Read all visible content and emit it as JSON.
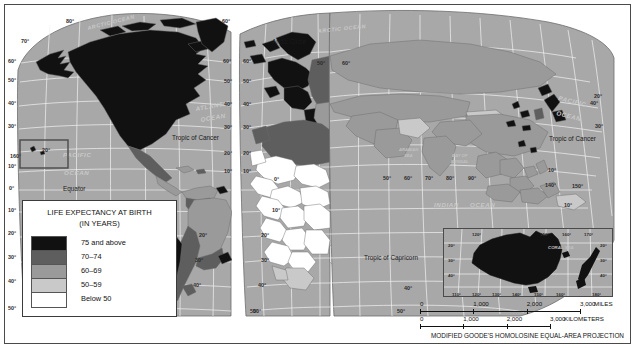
{
  "legend": {
    "title_line1": "LIFE EXPECTANCY AT BIRTH",
    "title_line2": "(IN YEARS)",
    "classes": [
      {
        "label": "75 and above",
        "color": "#111111"
      },
      {
        "label": "70–74",
        "color": "#5e5e5e"
      },
      {
        "label": "60–69",
        "color": "#9a9a9a"
      },
      {
        "label": "50–59",
        "color": "#c9c9c9"
      },
      {
        "label": "Below 50",
        "color": "#ffffff"
      }
    ]
  },
  "map": {
    "ocean_labels": [
      {
        "text": "ARCTIC OCEAN",
        "x": 88,
        "y": 30,
        "size": 5.4,
        "rot": -14
      },
      {
        "text": "ARCTIC OCEAN",
        "x": 318,
        "y": 33,
        "size": 5.4,
        "rot": -6
      },
      {
        "text": "ATLANTIC",
        "x": 196,
        "y": 111,
        "size": 6.2,
        "rot": -10
      },
      {
        "text": "OCEAN",
        "x": 201,
        "y": 122,
        "size": 6.2,
        "rot": -10
      },
      {
        "text": "PACIFIC",
        "x": 63,
        "y": 157,
        "size": 6.2,
        "rot": 0
      },
      {
        "text": "OCEAN",
        "x": 64,
        "y": 175,
        "size": 6.2,
        "rot": 0
      },
      {
        "text": "PACIFIC",
        "x": 558,
        "y": 100,
        "size": 6.2,
        "rot": 14
      },
      {
        "text": "OCEAN",
        "x": 556,
        "y": 115,
        "size": 6.2,
        "rot": 14
      },
      {
        "text": "INDIAN",
        "x": 434,
        "y": 207,
        "size": 6.2,
        "rot": 0
      },
      {
        "text": "OCEAN",
        "x": 470,
        "y": 207,
        "size": 6.2,
        "rot": 0
      }
    ],
    "sea_labels": [
      {
        "text": "ARABIAN",
        "x": 399,
        "y": 151,
        "size": 4.2
      },
      {
        "text": "SEA",
        "x": 404,
        "y": 157,
        "size": 4.2
      },
      {
        "text": "BAY OF",
        "x": 452,
        "y": 157,
        "size": 4.2
      },
      {
        "text": "BENGAL",
        "x": 451,
        "y": 163,
        "size": 4.2
      }
    ],
    "line_labels": [
      {
        "text": "Arctic Circle",
        "x": 272,
        "y": 44,
        "size": 6.4
      },
      {
        "text": "Tropic of Cancer",
        "x": 172,
        "y": 140,
        "size": 6.4
      },
      {
        "text": "Tropic of Cancer",
        "x": 549,
        "y": 141,
        "size": 6.4
      },
      {
        "text": "Equator",
        "x": 63,
        "y": 191,
        "size": 6.4
      },
      {
        "text": "Tropic of Capricorn",
        "x": 364,
        "y": 260,
        "size": 6.4
      }
    ],
    "lat_labels": [
      {
        "text": "80°",
        "x": 66,
        "y": 23
      },
      {
        "text": "70°",
        "x": 21,
        "y": 43
      },
      {
        "text": "60°",
        "x": 8,
        "y": 63
      },
      {
        "text": "50°",
        "x": 8,
        "y": 82
      },
      {
        "text": "40°",
        "x": 8,
        "y": 105
      },
      {
        "text": "30°",
        "x": 8,
        "y": 128
      },
      {
        "text": "20°",
        "x": 42,
        "y": 152
      },
      {
        "text": "10°",
        "x": 8,
        "y": 168
      },
      {
        "text": "0°",
        "x": 9,
        "y": 190
      },
      {
        "text": "10°",
        "x": 8,
        "y": 212
      },
      {
        "text": "20°",
        "x": 8,
        "y": 235
      },
      {
        "text": "30°",
        "x": 8,
        "y": 259
      },
      {
        "text": "40°",
        "x": 8,
        "y": 283
      },
      {
        "text": "50°",
        "x": 8,
        "y": 310
      },
      {
        "text": "60°",
        "x": 222,
        "y": 23
      },
      {
        "text": "60°",
        "x": 223,
        "y": 63
      },
      {
        "text": "50°",
        "x": 224,
        "y": 83
      },
      {
        "text": "40°",
        "x": 224,
        "y": 106
      },
      {
        "text": "30°",
        "x": 224,
        "y": 129
      },
      {
        "text": "20°",
        "x": 224,
        "y": 155
      },
      {
        "text": "10°",
        "x": 224,
        "y": 173
      },
      {
        "text": "60°",
        "x": 243,
        "y": 63
      },
      {
        "text": "50°",
        "x": 243,
        "y": 83
      },
      {
        "text": "40°",
        "x": 243,
        "y": 106
      },
      {
        "text": "30°",
        "x": 243,
        "y": 129
      },
      {
        "text": "20°",
        "x": 243,
        "y": 155
      },
      {
        "text": "10°",
        "x": 243,
        "y": 173
      },
      {
        "text": "10°",
        "x": 272,
        "y": 212
      },
      {
        "text": "20°",
        "x": 261,
        "y": 237
      },
      {
        "text": "30°",
        "x": 261,
        "y": 262
      },
      {
        "text": "40°",
        "x": 258,
        "y": 287
      },
      {
        "text": "20°",
        "x": 199,
        "y": 237
      },
      {
        "text": "30°",
        "x": 195,
        "y": 262
      },
      {
        "text": "40°",
        "x": 193,
        "y": 287
      },
      {
        "text": "50°",
        "x": 250,
        "y": 313
      },
      {
        "text": "50°",
        "x": 253,
        "y": 313
      },
      {
        "text": "10°",
        "x": 548,
        "y": 172
      },
      {
        "text": "20°",
        "x": 594,
        "y": 98
      },
      {
        "text": "30°",
        "x": 595,
        "y": 128
      },
      {
        "text": "40°",
        "x": 590,
        "y": 105
      },
      {
        "text": "10°",
        "x": 564,
        "y": 207
      },
      {
        "text": "20°",
        "x": 563,
        "y": 233
      },
      {
        "text": "30°",
        "x": 546,
        "y": 262
      },
      {
        "text": "40°",
        "x": 540,
        "y": 288
      },
      {
        "text": "50°",
        "x": 397,
        "y": 313
      },
      {
        "text": "40°",
        "x": 404,
        "y": 290
      }
    ],
    "lon_labels": [
      {
        "text": "160°",
        "x": 10,
        "y": 158
      },
      {
        "text": "0°",
        "x": 274,
        "y": 181
      },
      {
        "text": "50°",
        "x": 383,
        "y": 180
      },
      {
        "text": "60°",
        "x": 404,
        "y": 180
      },
      {
        "text": "70°",
        "x": 425,
        "y": 180
      },
      {
        "text": "80°",
        "x": 446,
        "y": 180
      },
      {
        "text": "90°",
        "x": 468,
        "y": 180
      },
      {
        "text": "140°",
        "x": 545,
        "y": 187
      },
      {
        "text": "150°",
        "x": 572,
        "y": 188
      },
      {
        "text": "50°",
        "x": 317,
        "y": 65
      },
      {
        "text": "60°",
        "x": 342,
        "y": 65
      }
    ]
  },
  "inset": {
    "sea_label": "CORAL SEA",
    "lon_labels_top": [
      "120°",
      "150°",
      "160°",
      "170°"
    ],
    "lon_labels_bottom": [
      "110°",
      "120°",
      "130°",
      "140°",
      "150°",
      "160°",
      "180°"
    ],
    "lat_labels": [
      "20°",
      "30°",
      "40°"
    ]
  },
  "scales": {
    "miles": {
      "ticks": [
        "0",
        "1,000",
        "2,000",
        "3,000"
      ],
      "unit": "MILES"
    },
    "kilometers": {
      "ticks": [
        "0",
        "1,000",
        "2,000",
        "3,000"
      ],
      "unit": "KILOMETERS"
    }
  },
  "projection_note": "MODIFIED GOODE'S HOMOLOSINE EQUAL-AREA PROJECTION"
}
